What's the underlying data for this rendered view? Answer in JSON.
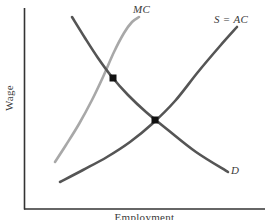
{
  "chart_data": {
    "type": "line",
    "title": "",
    "subtitle": "",
    "xlabel": "Employment",
    "ylabel": "Wage",
    "grid": false,
    "legend_position": "inline-curve-labels",
    "axis": {
      "x_range_label": "",
      "y_range_label": "",
      "ticks_shown": false,
      "tick_labels_x": [],
      "tick_labels_y": []
    },
    "series": [
      {
        "name": "MC",
        "label": "MC",
        "color": "#a8a8a8",
        "shape": "upward-sloping convex (marginal cost of labor)",
        "points": [
          [
            55,
            162
          ],
          [
            66,
            145
          ],
          [
            79,
            124
          ],
          [
            92,
            100
          ],
          [
            103,
            77
          ],
          [
            114,
            52
          ],
          [
            124,
            33
          ],
          [
            132,
            22
          ],
          [
            139,
            17
          ]
        ]
      },
      {
        "name": "S = AC",
        "label": "S = AC",
        "color": "#555555",
        "shape": "upward-sloping convex (labor supply / average cost)",
        "points": [
          [
            60,
            182
          ],
          [
            83,
            170
          ],
          [
            107,
            157
          ],
          [
            130,
            142
          ],
          [
            152,
            124
          ],
          [
            175,
            101
          ],
          [
            198,
            72
          ],
          [
            220,
            46
          ],
          [
            237,
            27
          ]
        ]
      },
      {
        "name": "D",
        "label": "D",
        "color": "#555555",
        "shape": "downward-sloping convex (labor demand / marginal revenue product)",
        "points": [
          [
            72,
            17
          ],
          [
            85,
            38
          ],
          [
            98,
            58
          ],
          [
            112,
            77
          ],
          [
            128,
            95
          ],
          [
            146,
            112
          ],
          [
            168,
            130
          ],
          [
            196,
            152
          ],
          [
            228,
            172
          ]
        ]
      }
    ],
    "markers": [
      {
        "name": "monopsony-equilibrium",
        "x": 113,
        "y": 78,
        "color": "#111111",
        "on": "MC x D"
      },
      {
        "name": "competitive-equilibrium",
        "x": 155,
        "y": 120,
        "color": "#111111",
        "on": "S=AC x D"
      }
    ],
    "annotations": []
  },
  "labels": {
    "mc": "MC",
    "s_ac": "S = AC",
    "d": "D",
    "y_axis": "Wage",
    "x_axis": "Employment"
  },
  "colors": {
    "mc_curve": "#a8a8a8",
    "supply_curve": "#555555",
    "demand_curve": "#555555",
    "axis": "#333333",
    "marker": "#111111",
    "background": "#ffffff"
  }
}
